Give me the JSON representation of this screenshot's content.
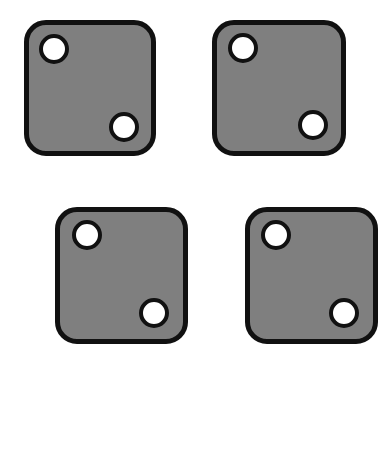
{
  "scene": {
    "background": "#ffffff",
    "die_fill": "#7f7f7f",
    "outline": "#111111",
    "pip_fill": "#ffffff",
    "description": "Four gray dice each showing the face with two pips"
  },
  "dice": [
    {
      "label": "die-1",
      "face_value": 2,
      "x": 24,
      "y": 20,
      "w": 132,
      "h": 136,
      "pips": [
        {
          "cx": 54,
          "cy": 49,
          "r": 15
        },
        {
          "cx": 124,
          "cy": 127,
          "r": 15
        }
      ]
    },
    {
      "label": "die-2",
      "face_value": 2,
      "x": 212,
      "y": 20,
      "w": 134,
      "h": 136,
      "pips": [
        {
          "cx": 243,
          "cy": 48,
          "r": 15
        },
        {
          "cx": 313,
          "cy": 125,
          "r": 15
        }
      ]
    },
    {
      "label": "die-3",
      "face_value": 2,
      "x": 55,
      "y": 207,
      "w": 133,
      "h": 137,
      "pips": [
        {
          "cx": 87,
          "cy": 235,
          "r": 15
        },
        {
          "cx": 154,
          "cy": 313,
          "r": 15
        }
      ]
    },
    {
      "label": "die-4",
      "face_value": 2,
      "x": 245,
      "y": 207,
      "w": 133,
      "h": 137,
      "pips": [
        {
          "cx": 276,
          "cy": 235,
          "r": 15
        },
        {
          "cx": 344,
          "cy": 313,
          "r": 15
        }
      ]
    }
  ]
}
